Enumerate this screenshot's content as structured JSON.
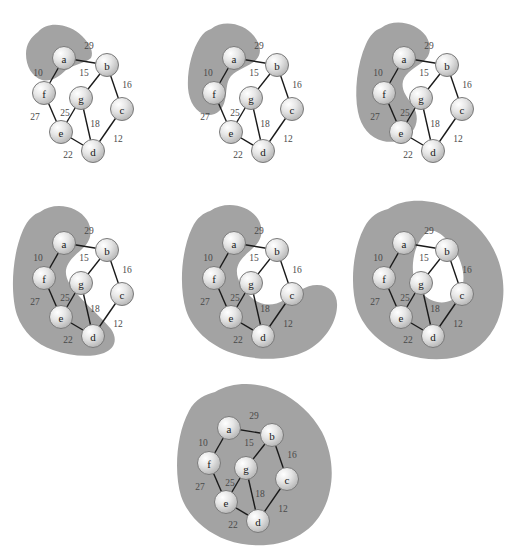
{
  "figure": {
    "background_color": "#ffffff",
    "blob_color": "#a3a3a3",
    "edge_color": "#1a1a1a",
    "node_fill": "#dcdcdc",
    "node_stroke": "#7a7a7a",
    "node_radius": 11.5
  },
  "graph": {
    "nodes": [
      {
        "id": "a",
        "label": "a",
        "x": 56,
        "y": 50
      },
      {
        "id": "b",
        "label": "b",
        "x": 99,
        "y": 57
      },
      {
        "id": "c",
        "label": "c",
        "x": 114,
        "y": 101
      },
      {
        "id": "d",
        "label": "d",
        "x": 85,
        "y": 143
      },
      {
        "id": "e",
        "label": "e",
        "x": 53,
        "y": 124
      },
      {
        "id": "f",
        "label": "f",
        "x": 36,
        "y": 85
      },
      {
        "id": "g",
        "label": "g",
        "x": 73,
        "y": 90
      }
    ],
    "edges": [
      {
        "from": "a",
        "to": "b",
        "weight": "29",
        "lx": 81,
        "ly": 38
      },
      {
        "from": "a",
        "to": "f",
        "weight": "10",
        "lx": 30,
        "ly": 65
      },
      {
        "from": "b",
        "to": "g",
        "weight": "15",
        "lx": 76,
        "ly": 65
      },
      {
        "from": "b",
        "to": "c",
        "weight": "16",
        "lx": 119,
        "ly": 77
      },
      {
        "from": "f",
        "to": "e",
        "weight": "27",
        "lx": 27,
        "ly": 109
      },
      {
        "from": "g",
        "to": "e",
        "weight": "25",
        "lx": 57,
        "ly": 105
      },
      {
        "from": "g",
        "to": "d",
        "weight": "18",
        "lx": 87,
        "ly": 116
      },
      {
        "from": "c",
        "to": "d",
        "weight": "12",
        "lx": 110,
        "ly": 131
      },
      {
        "from": "e",
        "to": "d",
        "weight": "22",
        "lx": 60,
        "ly": 147
      }
    ]
  },
  "panels": [
    {
      "name": "step-1",
      "step_index": "1",
      "origin_x": 8,
      "origin_y": 8,
      "tree_nodes": "a",
      "blob_path": "M 30 24 C 40 12, 62 16, 74 28 C 82 36, 86 44, 83 50 C 76 56, 66 56, 58 62 C 50 70, 42 74, 34 72 C 24 69, 18 58, 18 46 C 18 36, 23 29, 30 24 Z"
    },
    {
      "name": "step-2",
      "step_index": "2",
      "origin_x": 178,
      "origin_y": 8,
      "tree_nodes": "a, f",
      "blob_path": "M 33 21 C 45 11, 66 15, 76 28 C 83 37, 84 46, 78 52 C 70 59, 60 61, 53 68 C 48 74, 49 83, 47 92 C 45 102, 38 108, 29 107 C 18 105, 11 94, 10 80 C 9 62, 14 42, 22 30 C 25 25, 29 22, 33 21 Z"
    },
    {
      "name": "step-3",
      "step_index": "3",
      "origin_x": 348,
      "origin_y": 8,
      "tree_nodes": "a, f, e",
      "blob_path": "M 33 20 C 46 10, 68 14, 78 28 C 84 38, 83 47, 76 53 C 67 60, 58 64, 55 73 C 53 81, 58 88, 63 95 C 69 103, 71 112, 66 121 C 60 131, 47 136, 35 133 C 22 130, 13 119, 10 104 C 6 84, 9 56, 18 36 C 22 27, 27 22, 33 20 Z"
    },
    {
      "name": "step-4",
      "step_index": "4",
      "origin_x": 8,
      "origin_y": 193,
      "tree_nodes": "a, f, e, d",
      "blob_path": "M 32 19 C 47 8, 70 13, 79 27 C 85 37, 83 47, 76 54 C 68 62, 60 67, 58 77 C 57 86, 63 94, 71 103 C 81 114, 94 125, 103 136 C 110 146, 107 156, 96 160 C 82 165, 62 163, 45 157 C 28 151, 15 139, 9 122 C 2 100, 4 62, 15 37 C 20 26, 26 21, 32 19 Z"
    },
    {
      "name": "step-5",
      "step_index": "5",
      "origin_x": 178,
      "origin_y": 193,
      "tree_nodes": "a, f, e, d, c",
      "blob_path": "M 32 18 C 48 7, 71 12, 80 26 C 86 36, 84 46, 77 53 C 69 61, 61 66, 59 76 C 58 86, 64 95, 73 104 C 82 113, 95 114, 106 107 C 117 100, 128 92, 139 92 C 152 92, 160 101, 159 114 C 158 131, 146 149, 128 158 C 108 168, 78 168, 54 160 C 31 152, 14 136, 8 117 C 1 94, 3 58, 14 35 C 19 24, 26 20, 32 18 Z"
    },
    {
      "name": "step-6",
      "step_index": "6",
      "origin_x": 348,
      "origin_y": 193,
      "tree_nodes": "a, b, c, d, e, f",
      "blob_path": "M 40 16 C 56 5, 82 6, 100 14 C 118 22, 132 34, 142 50 C 152 66, 157 86, 155 106 C 153 127, 143 146, 126 157 C 108 168, 80 169, 57 161 C 34 153, 16 136, 9 116 C 2 94, 4 58, 16 35 C 22 23, 31 18, 40 16 Z M 78 40 C 70 48, 66 58, 65 70 C 64 82, 67 92, 74 100 C 82 109, 94 112, 104 107 C 113 102, 117 91, 115 79 C 113 65, 105 52, 95 43 C 89 38, 83 36, 78 40 Z"
    },
    {
      "name": "step-7",
      "step_index": "7",
      "origin_x": 173,
      "origin_y": 378,
      "tree_nodes": "a, b, c, d, e, f, g",
      "blob_path": "M 42 14 C 60 3, 86 4, 105 13 C 124 22, 139 36, 149 54 C 158 72, 161 93, 157 112 C 153 133, 141 150, 123 159 C 104 169, 76 170, 54 162 C 32 154, 15 138, 8 118 C 1 95, 3 57, 16 33 C 22 21, 33 16, 42 14 Z"
    }
  ]
}
